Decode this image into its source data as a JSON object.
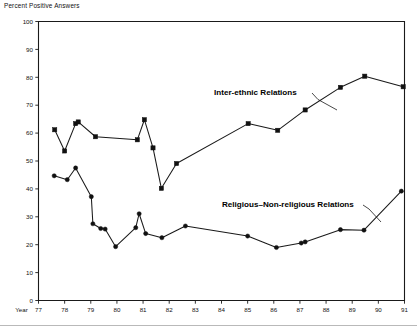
{
  "figure": {
    "axis_title": "Percent Positive Answers",
    "year_axis_label": "Year"
  },
  "chart_data": {
    "type": "line",
    "title": "Percent Positive Answers",
    "xlabel": "Year",
    "ylabel": "Percent Positive Answers",
    "xlim": [
      77,
      91
    ],
    "ylim": [
      0,
      100
    ],
    "grid": false,
    "legend_position": "inline-annotation",
    "xticks": [
      "77",
      "78",
      "79",
      "80",
      "81",
      "82",
      "83",
      "84",
      "85",
      "86",
      "87",
      "88",
      "89",
      "90",
      "91"
    ],
    "yticks": [
      "0",
      "10",
      "20",
      "30",
      "40",
      "50",
      "60",
      "70",
      "80",
      "90",
      "100"
    ],
    "series": [
      {
        "name": "Inter-ethnic Relations",
        "marker": "square",
        "label_x": 77.3,
        "label_y": 100.0,
        "points": [
          {
            "x": 77.62,
            "y": 61.2
          },
          {
            "x": 78.0,
            "y": 53.6
          },
          {
            "x": 78.42,
            "y": 63.4
          },
          {
            "x": 78.52,
            "y": 64.0
          },
          {
            "x": 79.18,
            "y": 58.7
          },
          {
            "x": 80.78,
            "y": 57.6
          },
          {
            "x": 81.05,
            "y": 64.8
          },
          {
            "x": 81.38,
            "y": 54.7
          },
          {
            "x": 81.7,
            "y": 40.2
          },
          {
            "x": 82.28,
            "y": 49.1
          },
          {
            "x": 85.02,
            "y": 63.4
          },
          {
            "x": 86.15,
            "y": 61.0
          },
          {
            "x": 87.2,
            "y": 68.3
          },
          {
            "x": 88.55,
            "y": 76.4
          },
          {
            "x": 89.48,
            "y": 80.4
          },
          {
            "x": 90.95,
            "y": 76.6
          }
        ]
      },
      {
        "name": "Religious–Non-religious Relations",
        "marker": "circle",
        "label_x": 83.1,
        "label_y": 36.0,
        "points": [
          {
            "x": 77.6,
            "y": 44.7
          },
          {
            "x": 78.1,
            "y": 43.3
          },
          {
            "x": 78.42,
            "y": 47.5
          },
          {
            "x": 79.02,
            "y": 37.2
          },
          {
            "x": 79.08,
            "y": 27.5
          },
          {
            "x": 79.38,
            "y": 25.8
          },
          {
            "x": 79.55,
            "y": 25.6
          },
          {
            "x": 79.95,
            "y": 19.3
          },
          {
            "x": 80.72,
            "y": 26.1
          },
          {
            "x": 80.85,
            "y": 31.1
          },
          {
            "x": 81.1,
            "y": 24.0
          },
          {
            "x": 81.72,
            "y": 22.5
          },
          {
            "x": 82.62,
            "y": 26.7
          },
          {
            "x": 85.0,
            "y": 23.1
          },
          {
            "x": 86.1,
            "y": 19.0
          },
          {
            "x": 87.05,
            "y": 20.6
          },
          {
            "x": 87.2,
            "y": 21.0
          },
          {
            "x": 88.55,
            "y": 25.4
          },
          {
            "x": 89.45,
            "y": 25.2
          },
          {
            "x": 90.88,
            "y": 39.2
          }
        ]
      }
    ]
  },
  "labels": {
    "inter_ethnic": "Inter-ethnic Relations",
    "religious": "Religious–Non-religious Relations"
  }
}
